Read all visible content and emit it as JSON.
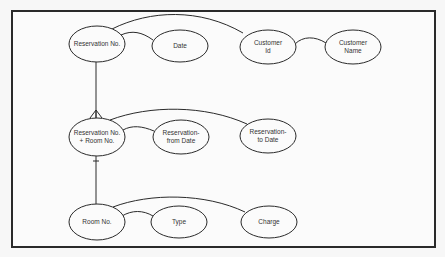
{
  "diagram": {
    "type": "er-diagram",
    "frame": {
      "stroke": "#2a2a2a",
      "fill": "#fbfbfb"
    },
    "nodes": [
      {
        "id": "reservation_no",
        "lines": [
          "Reservation No."
        ],
        "cx": 97,
        "cy": 44,
        "rx": 28,
        "ry": 18
      },
      {
        "id": "date",
        "lines": [
          "Date"
        ],
        "cx": 180,
        "cy": 46,
        "rx": 28,
        "ry": 16
      },
      {
        "id": "customer_id",
        "lines": [
          "Customer",
          "Id"
        ],
        "cx": 268,
        "cy": 47,
        "rx": 28,
        "ry": 17
      },
      {
        "id": "customer_name",
        "lines": [
          "Customer",
          "Name"
        ],
        "cx": 353,
        "cy": 47,
        "rx": 28,
        "ry": 17
      },
      {
        "id": "reservation_room",
        "lines": [
          "Reservation No.",
          "+ Room No."
        ],
        "cx": 97,
        "cy": 137,
        "rx": 28,
        "ry": 19
      },
      {
        "id": "reservation_from",
        "lines": [
          "Reservation-",
          "from Date"
        ],
        "cx": 181,
        "cy": 137,
        "rx": 28,
        "ry": 17
      },
      {
        "id": "reservation_to",
        "lines": [
          "Reservation-",
          "to Date"
        ],
        "cx": 268,
        "cy": 136,
        "rx": 28,
        "ry": 17
      },
      {
        "id": "room_no",
        "lines": [
          "Room No."
        ],
        "cx": 97,
        "cy": 222,
        "rx": 28,
        "ry": 18
      },
      {
        "id": "type",
        "lines": [
          "Type"
        ],
        "cx": 179,
        "cy": 222,
        "rx": 28,
        "ry": 16
      },
      {
        "id": "charge",
        "lines": [
          "Charge"
        ],
        "cx": 269,
        "cy": 222,
        "rx": 28,
        "ry": 16
      }
    ],
    "edges": [
      {
        "from": "reservation_no",
        "to": "date",
        "d": "M121,35 C132,30 142,32 153,40"
      },
      {
        "from": "reservation_no",
        "to": "customer_id",
        "d": "M112,29 C150,10 200,8 243,33"
      },
      {
        "from": "customer_id",
        "to": "customer_name",
        "d": "M295,44 C303,36 315,36 326,43"
      },
      {
        "from": "reservation_no",
        "to": "reservation_room",
        "d": "M96,62 L96,118",
        "relationship": "one-to-many",
        "end": "crow-foot"
      },
      {
        "from": "reservation_room",
        "to": "reservation_from",
        "d": "M123,130 C132,125 142,126 154,131"
      },
      {
        "from": "reservation_room",
        "to": "reservation_to",
        "d": "M110,120 C150,105 205,105 247,124"
      },
      {
        "from": "room_no",
        "to": "reservation_room",
        "d": "M96,204 L96,156",
        "relationship": "one",
        "end": "bar"
      },
      {
        "from": "room_no",
        "to": "type",
        "d": "M122,216 C132,210 143,210 153,216"
      },
      {
        "from": "room_no",
        "to": "charge",
        "d": "M113,207 C150,193 205,193 245,212"
      }
    ],
    "stroke_color": "#2a2a2a"
  }
}
